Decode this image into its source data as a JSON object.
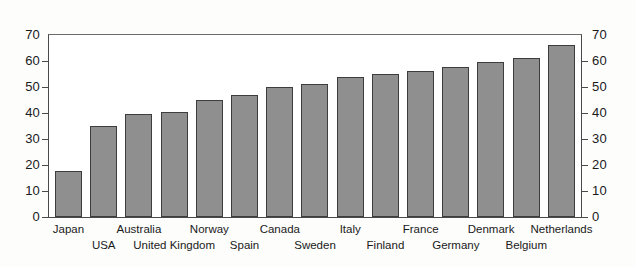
{
  "chart_data": {
    "type": "bar",
    "title": "",
    "subtitle": "",
    "xlabel": "",
    "ylabel": "",
    "categories": [
      "Japan",
      "USA",
      "Australia",
      "United Kingdom",
      "Norway",
      "Spain",
      "Canada",
      "Sweden",
      "Italy",
      "Finland",
      "France",
      "Germany",
      "Denmark",
      "Belgium",
      "Netherlands"
    ],
    "values": [
      17.5,
      35,
      39.5,
      40.5,
      45,
      47,
      50,
      51,
      54,
      55,
      56,
      57.5,
      59.5,
      61,
      66
    ],
    "ylim": [
      0,
      70
    ],
    "y_ticks": [
      0,
      10,
      20,
      30,
      40,
      50,
      60,
      70
    ],
    "y_ticks_right": [
      0,
      10,
      20,
      30,
      40,
      50,
      60,
      70
    ],
    "grid": false,
    "legend": "none",
    "bar_color": "#8f8f8f",
    "bar_border_color": "#3d3d3d",
    "axis_color": "#4a4a4a",
    "label_rows": [
      0,
      1,
      0,
      1,
      0,
      1,
      0,
      1,
      0,
      1,
      0,
      1,
      0,
      1,
      0
    ]
  },
  "axis": {
    "left_tick_labels": [
      "70",
      "60",
      "50",
      "40",
      "30",
      "20",
      "10",
      "0"
    ],
    "right_tick_labels": [
      "70",
      "60",
      "50",
      "40",
      "30",
      "20",
      "10",
      "0"
    ]
  }
}
